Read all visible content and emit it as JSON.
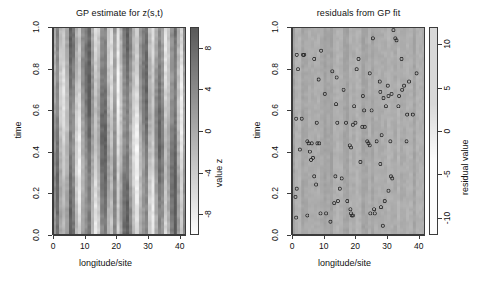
{
  "figure": {
    "width": 478,
    "height": 286,
    "background": "#ffffff"
  },
  "panels": [
    {
      "id": "gp-estimate",
      "title": "GP estimate for z(s,t)",
      "xlabel": "longitude/site",
      "ylabel": "time",
      "legend_label": "value z",
      "xticks": [
        "0",
        "10",
        "20",
        "30",
        "40"
      ],
      "yticks": [
        "0.0",
        "0.2",
        "0.4",
        "0.6",
        "0.8",
        "1.0"
      ],
      "legend_ticks": [
        "-8",
        "-4",
        "0",
        "4",
        "8"
      ]
    },
    {
      "id": "gp-residuals",
      "title": "residuals from GP fit",
      "xlabel": "longitude/site",
      "ylabel": "time",
      "legend_label": "residual value",
      "xticks": [
        "0",
        "10",
        "20",
        "30",
        "40"
      ],
      "yticks": [
        "0.0",
        "0.2",
        "0.4",
        "0.6",
        "0.8",
        "1.0"
      ],
      "legend_ticks": [
        "-10",
        "-5",
        "0",
        "5",
        "10"
      ]
    }
  ],
  "chart_data": [
    {
      "type": "heatmap",
      "panel": "gp-estimate",
      "title": "GP estimate for z(s,t)",
      "xlabel": "longitude/site",
      "ylabel": "time",
      "colorbar_label": "value z",
      "xlim": [
        0,
        42
      ],
      "ylim": [
        0,
        1
      ],
      "zlim": [
        -10,
        10
      ],
      "colorbar_ticks": [
        -8,
        -4,
        0,
        4,
        8
      ],
      "xticks": [
        0,
        10,
        20,
        30,
        40
      ],
      "yticks": [
        0.0,
        0.2,
        0.4,
        0.6,
        0.8,
        1.0
      ],
      "grid": false,
      "colormap": "gray (dark = high, light = low)",
      "note": "Strongly banded vertical stripe structure: value depends mainly on longitude/site with weak time drift.",
      "n_sites": 42,
      "n_times": 60,
      "site_mean_z": [
        2.1,
        6.4,
        -1.8,
        -4.6,
        -0.3,
        7.9,
        5.2,
        -3.1,
        -6.2,
        1.4,
        4.8,
        8.3,
        0.6,
        -5.4,
        -2.2,
        6.1,
        7.5,
        -0.9,
        -4.1,
        3.3,
        -6.8,
        -1.1,
        5.6,
        8.1,
        2.7,
        -3.6,
        -7.2,
        0.2,
        4.3,
        7.0,
        -2.5,
        -5.9,
        1.9,
        6.7,
        3.8,
        -4.9,
        -1.4,
        5.0,
        8.5,
        -0.5,
        -6.5,
        2.4
      ]
    },
    {
      "type": "heatmap+scatter",
      "panel": "gp-residuals",
      "title": "residuals from GP fit",
      "xlabel": "longitude/site",
      "ylabel": "time",
      "colorbar_label": "residual value",
      "xlim": [
        0,
        42
      ],
      "ylim": [
        0,
        1
      ],
      "zlim": [
        -12,
        12
      ],
      "colorbar_ticks": [
        -10,
        -5,
        0,
        5,
        10
      ],
      "xticks": [
        0,
        10,
        20,
        30,
        40
      ],
      "yticks": [
        0.0,
        0.2,
        0.4,
        0.6,
        0.8,
        1.0
      ],
      "grid": false,
      "colormap": "gray (nearly uniform light - residuals close to zero)",
      "note": "Background residual field is near zero (uniform pale gray); open circles mark observed data locations.",
      "marker": "open circle",
      "n_points": 96,
      "points": [
        [
          1.2,
          0.87
        ],
        [
          3.6,
          0.87
        ],
        [
          1.6,
          0.8
        ],
        [
          6.8,
          0.85
        ],
        [
          9.0,
          0.89
        ],
        [
          8.2,
          0.75
        ],
        [
          12.6,
          0.79
        ],
        [
          14.0,
          0.76
        ],
        [
          21.0,
          0.85
        ],
        [
          20.4,
          0.8
        ],
        [
          25.6,
          0.95
        ],
        [
          32.2,
          0.99
        ],
        [
          32.8,
          0.95
        ],
        [
          33.2,
          0.94
        ],
        [
          34.8,
          0.85
        ],
        [
          24.6,
          0.78
        ],
        [
          27.8,
          0.74
        ],
        [
          30.4,
          0.72
        ],
        [
          37.2,
          0.74
        ],
        [
          39.6,
          0.78
        ],
        [
          10.2,
          0.68
        ],
        [
          16.2,
          0.7
        ],
        [
          22.4,
          0.67
        ],
        [
          28.0,
          0.69
        ],
        [
          29.0,
          0.66
        ],
        [
          30.6,
          0.67
        ],
        [
          31.6,
          0.68
        ],
        [
          35.6,
          0.72
        ],
        [
          13.8,
          0.63
        ],
        [
          19.6,
          0.62
        ],
        [
          22.8,
          0.6
        ],
        [
          29.8,
          0.62
        ],
        [
          1.0,
          0.56
        ],
        [
          2.8,
          0.56
        ],
        [
          7.6,
          0.54
        ],
        [
          14.2,
          0.54
        ],
        [
          19.2,
          0.53
        ],
        [
          22.2,
          0.52
        ],
        [
          36.6,
          0.58
        ],
        [
          38.4,
          0.58
        ],
        [
          4.6,
          0.45
        ],
        [
          2.2,
          0.41
        ],
        [
          5.0,
          0.44
        ],
        [
          6.0,
          0.44
        ],
        [
          8.4,
          0.44
        ],
        [
          5.4,
          0.4
        ],
        [
          23.8,
          0.45
        ],
        [
          24.2,
          0.44
        ],
        [
          24.6,
          0.43
        ],
        [
          28.4,
          0.48
        ],
        [
          31.2,
          0.45
        ],
        [
          36.4,
          0.45
        ],
        [
          18.2,
          0.43
        ],
        [
          18.6,
          0.42
        ],
        [
          5.8,
          0.36
        ],
        [
          6.4,
          0.37
        ],
        [
          21.6,
          0.35
        ],
        [
          28.0,
          0.34
        ],
        [
          6.8,
          0.28
        ],
        [
          7.4,
          0.24
        ],
        [
          13.6,
          0.28
        ],
        [
          15.6,
          0.27
        ],
        [
          15.0,
          0.22
        ],
        [
          31.4,
          0.28
        ],
        [
          31.8,
          0.27
        ],
        [
          1.2,
          0.22
        ],
        [
          30.6,
          0.21
        ],
        [
          0.8,
          0.18
        ],
        [
          14.4,
          0.16
        ],
        [
          17.4,
          0.16
        ],
        [
          18.4,
          0.12
        ],
        [
          18.6,
          0.1
        ],
        [
          18.8,
          0.09
        ],
        [
          26.0,
          0.12
        ],
        [
          28.2,
          0.13
        ],
        [
          29.4,
          0.16
        ],
        [
          8.8,
          0.1
        ],
        [
          1.0,
          0.08
        ],
        [
          4.6,
          0.09
        ],
        [
          12.0,
          0.06
        ],
        [
          28.8,
          0.04
        ],
        [
          3.2,
          0.87
        ],
        [
          7.8,
          0.44
        ],
        [
          17.0,
          0.54
        ],
        [
          20.0,
          0.54
        ],
        [
          23.0,
          0.52
        ],
        [
          25.2,
          0.6
        ],
        [
          26.8,
          0.45
        ],
        [
          33.8,
          0.62
        ],
        [
          34.0,
          0.67
        ],
        [
          35.0,
          0.7
        ],
        [
          10.6,
          0.1
        ],
        [
          19.2,
          0.09
        ],
        [
          24.8,
          0.1
        ],
        [
          26.2,
          0.1
        ],
        [
          13.2,
          0.15
        ]
      ]
    }
  ]
}
